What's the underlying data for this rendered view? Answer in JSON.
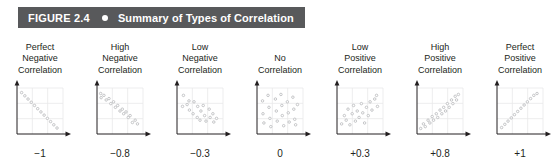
{
  "figure": {
    "number": "FIGURE 2.4",
    "bullet": "bullet-dot",
    "title": "Summary of Types of Correlation",
    "bar_color": "#58595b",
    "text_color": "#ffffff"
  },
  "plot_style": {
    "axis_color": "#231f20",
    "grid_color": "#e9e9ea",
    "point_stroke": "#b7b9bb",
    "point_fill": "#ffffff"
  },
  "chart_data": {
    "type": "scatter",
    "title": "Summary of Types of Correlation",
    "xlabel": "",
    "ylabel": "",
    "xlim": [
      0,
      100
    ],
    "ylim": [
      0,
      100
    ],
    "grid": true,
    "legend": "none",
    "panels": [
      {
        "id": "perfect-negative",
        "title_lines": [
          "Perfect",
          "Negative",
          "Correlation"
        ],
        "value": "−1",
        "r": -1,
        "points": [
          [
            10,
            90
          ],
          [
            17,
            83
          ],
          [
            24,
            76
          ],
          [
            31,
            69
          ],
          [
            38,
            62
          ],
          [
            45,
            55
          ],
          [
            52,
            48
          ],
          [
            59,
            41
          ],
          [
            66,
            34
          ],
          [
            73,
            27
          ],
          [
            80,
            20
          ],
          [
            87,
            13
          ]
        ]
      },
      {
        "id": "high-negative",
        "title_lines": [
          "High",
          "Negative",
          "Correlation"
        ],
        "value": "−0.8",
        "r": -0.8,
        "points": [
          [
            8,
            88
          ],
          [
            9,
            79
          ],
          [
            15,
            84
          ],
          [
            20,
            74
          ],
          [
            26,
            77
          ],
          [
            30,
            66
          ],
          [
            36,
            70
          ],
          [
            40,
            58
          ],
          [
            45,
            62
          ],
          [
            50,
            50
          ],
          [
            55,
            54
          ],
          [
            58,
            44
          ],
          [
            63,
            48
          ],
          [
            68,
            36
          ],
          [
            72,
            40
          ],
          [
            77,
            25
          ],
          [
            83,
            30
          ],
          [
            88,
            22
          ]
        ]
      },
      {
        "id": "low-negative",
        "title_lines": [
          "Low",
          "Negative",
          "Correlation"
        ],
        "value": "−0.3",
        "r": -0.3,
        "points": [
          [
            14,
            84
          ],
          [
            12,
            60
          ],
          [
            22,
            64
          ],
          [
            26,
            72
          ],
          [
            27,
            52
          ],
          [
            37,
            70
          ],
          [
            35,
            44
          ],
          [
            45,
            60
          ],
          [
            44,
            36
          ],
          [
            52,
            50
          ],
          [
            50,
            30
          ],
          [
            57,
            62
          ],
          [
            60,
            40
          ],
          [
            63,
            28
          ],
          [
            70,
            54
          ],
          [
            72,
            36
          ],
          [
            78,
            44
          ],
          [
            80,
            26
          ],
          [
            86,
            34
          ]
        ]
      },
      {
        "id": "no-correlation",
        "title_lines": [
          "No",
          "Correlation"
        ],
        "value": "0",
        "r": 0,
        "points": [
          [
            12,
            72
          ],
          [
            13,
            44
          ],
          [
            15,
            24
          ],
          [
            24,
            84
          ],
          [
            26,
            58
          ],
          [
            28,
            34
          ],
          [
            30,
            16
          ],
          [
            40,
            76
          ],
          [
            42,
            50
          ],
          [
            44,
            28
          ],
          [
            52,
            86
          ],
          [
            54,
            62
          ],
          [
            55,
            40
          ],
          [
            58,
            18
          ],
          [
            66,
            70
          ],
          [
            68,
            46
          ],
          [
            70,
            26
          ],
          [
            78,
            80
          ],
          [
            80,
            54
          ],
          [
            82,
            32
          ],
          [
            84,
            20
          ],
          [
            88,
            64
          ]
        ]
      },
      {
        "id": "low-positive",
        "title_lines": [
          "Low",
          "Positive",
          "Correlation"
        ],
        "value": "+0.3",
        "r": 0.3,
        "points": [
          [
            10,
            22
          ],
          [
            16,
            40
          ],
          [
            20,
            30
          ],
          [
            24,
            54
          ],
          [
            28,
            20
          ],
          [
            33,
            44
          ],
          [
            36,
            62
          ],
          [
            40,
            28
          ],
          [
            44,
            50
          ],
          [
            48,
            36
          ],
          [
            53,
            66
          ],
          [
            56,
            46
          ],
          [
            60,
            24
          ],
          [
            64,
            58
          ],
          [
            68,
            40
          ],
          [
            72,
            70
          ],
          [
            76,
            52
          ],
          [
            82,
            76
          ],
          [
            86,
            84
          ],
          [
            88,
            60
          ]
        ]
      },
      {
        "id": "high-positive",
        "title_lines": [
          "High",
          "Positive",
          "Correlation"
        ],
        "value": "+0.8",
        "r": 0.8,
        "points": [
          [
            8,
            12
          ],
          [
            14,
            22
          ],
          [
            18,
            16
          ],
          [
            24,
            30
          ],
          [
            28,
            24
          ],
          [
            33,
            38
          ],
          [
            36,
            30
          ],
          [
            42,
            44
          ],
          [
            45,
            36
          ],
          [
            50,
            52
          ],
          [
            54,
            44
          ],
          [
            58,
            58
          ],
          [
            62,
            50
          ],
          [
            66,
            66
          ],
          [
            70,
            58
          ],
          [
            75,
            74
          ],
          [
            78,
            66
          ],
          [
            83,
            82
          ],
          [
            86,
            74
          ],
          [
            90,
            86
          ]
        ]
      },
      {
        "id": "perfect-positive",
        "title_lines": [
          "Perfect",
          "Positive",
          "Correlation"
        ],
        "value": "+1",
        "r": 1,
        "points": [
          [
            10,
            14
          ],
          [
            17,
            21
          ],
          [
            24,
            28
          ],
          [
            31,
            35
          ],
          [
            38,
            42
          ],
          [
            45,
            49
          ],
          [
            52,
            56
          ],
          [
            59,
            63
          ],
          [
            66,
            70
          ],
          [
            73,
            77
          ],
          [
            80,
            84
          ],
          [
            87,
            88
          ]
        ]
      }
    ]
  }
}
